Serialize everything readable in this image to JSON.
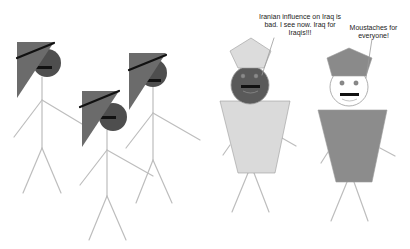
{
  "scene": {
    "background": "#ffffff",
    "line_color": "#bdbdbd",
    "figures": [
      {
        "id": "stick-figure-1",
        "type": "stick",
        "flag": {
          "points": "17,42 54,42 17,98",
          "fill": "#6b6b6b"
        },
        "band": {
          "x1": 17,
          "y1": 58,
          "x2": 54,
          "y2": 43
        },
        "head": {
          "cx": 47,
          "cy": 63,
          "r": 14,
          "fill": "#4e4e4e"
        },
        "mouth": {
          "x": 36,
          "y": 66,
          "w": 16,
          "h": 3
        },
        "body": {
          "x1": 42,
          "y1": 77,
          "x2": 42,
          "y2": 148
        },
        "arms": [
          {
            "x1": 42,
            "y1": 100,
            "x2": 14,
            "y2": 137
          },
          {
            "x1": 42,
            "y1": 100,
            "x2": 82,
            "y2": 124
          }
        ],
        "legs": [
          {
            "x1": 42,
            "y1": 148,
            "x2": 23,
            "y2": 193
          },
          {
            "x1": 42,
            "y1": 148,
            "x2": 61,
            "y2": 193
          }
        ]
      },
      {
        "id": "stick-figure-2",
        "type": "stick",
        "flag": {
          "points": "82,91 119,91 82,147",
          "fill": "#6b6b6b"
        },
        "band": {
          "x1": 80,
          "y1": 107,
          "x2": 119,
          "y2": 91
        },
        "head": {
          "cx": 113,
          "cy": 117,
          "r": 14,
          "fill": "#4e4e4e"
        },
        "mouth": {
          "x": 100,
          "y": 116,
          "w": 16,
          "h": 3
        },
        "body": {
          "x1": 107,
          "y1": 130,
          "x2": 107,
          "y2": 196
        },
        "arms": [
          {
            "x1": 107,
            "y1": 150,
            "x2": 80,
            "y2": 185
          },
          {
            "x1": 107,
            "y1": 150,
            "x2": 153,
            "y2": 176
          }
        ],
        "legs": [
          {
            "x1": 107,
            "y1": 196,
            "x2": 89,
            "y2": 240
          },
          {
            "x1": 107,
            "y1": 196,
            "x2": 126,
            "y2": 240
          }
        ]
      },
      {
        "id": "stick-figure-3",
        "type": "stick",
        "flag": {
          "points": "129,53 166,53 129,110",
          "fill": "#6b6b6b"
        },
        "band": {
          "x1": 129,
          "y1": 70,
          "x2": 166,
          "y2": 55
        },
        "head": {
          "cx": 153,
          "cy": 73,
          "r": 14,
          "fill": "#4e4e4e"
        },
        "mouth": {
          "x": 145,
          "y": 79,
          "w": 16,
          "h": 3
        },
        "body": {
          "x1": 153,
          "y1": 87,
          "x2": 153,
          "y2": 160
        },
        "arms": [
          {
            "x1": 153,
            "y1": 113,
            "x2": 126,
            "y2": 148
          },
          {
            "x1": 153,
            "y1": 113,
            "x2": 200,
            "y2": 140
          }
        ],
        "legs": [
          {
            "x1": 153,
            "y1": 160,
            "x2": 136,
            "y2": 203
          },
          {
            "x1": 153,
            "y1": 160,
            "x2": 172,
            "y2": 203
          }
        ]
      },
      {
        "id": "robed-figure-left",
        "type": "robed",
        "hat": {
          "points": "251,38 271,51 264,68 238,68 230,51",
          "fill": "#dcdcdc"
        },
        "head": {
          "cx": 250,
          "cy": 85,
          "r": 19,
          "fill": "#5a5a5a"
        },
        "eyes": [
          {
            "cx": 243,
            "cy": 76,
            "r": 2.2
          },
          {
            "cx": 256,
            "cy": 76,
            "r": 2.2
          }
        ],
        "eye_fill": "#8a8a8a",
        "mouth": {
          "x": 241,
          "y": 85,
          "w": 19,
          "h": 3
        },
        "robe": {
          "points": "220,101 290,101 275,173 238,173",
          "fill": "#dadada"
        },
        "arms": [
          {
            "x1": 230,
            "y1": 145,
            "x2": 223,
            "y2": 155
          },
          {
            "x1": 282,
            "y1": 138,
            "x2": 296,
            "y2": 146
          }
        ],
        "legs": [
          {
            "x1": 248,
            "y1": 173,
            "x2": 232,
            "y2": 212
          },
          {
            "x1": 254,
            "y1": 173,
            "x2": 269,
            "y2": 212
          }
        ],
        "pointer": {
          "x1": 274,
          "y1": 38,
          "x2": 262,
          "y2": 75
        }
      },
      {
        "id": "robed-figure-right",
        "type": "robed",
        "hat": {
          "points": "349,48 372,58 366,76 332,76 327,58",
          "fill": "#8a8a8a"
        },
        "head": {
          "cx": 349,
          "cy": 87,
          "r": 19,
          "fill": "#ffffff"
        },
        "eyes": [
          {
            "cx": 342,
            "cy": 83,
            "r": 2.2
          },
          {
            "cx": 356,
            "cy": 83,
            "r": 2.2
          }
        ],
        "eye_fill": "#8a8a8a",
        "mouth": {
          "x": 340,
          "y": 93,
          "w": 19,
          "h": 3
        },
        "robe": {
          "points": "318,110 387,110 372,182 336,182",
          "fill": "#8c8c8c"
        },
        "arms": [
          {
            "x1": 328,
            "y1": 152,
            "x2": 321,
            "y2": 163
          },
          {
            "x1": 380,
            "y1": 148,
            "x2": 395,
            "y2": 156
          }
        ],
        "legs": [
          {
            "x1": 347,
            "y1": 182,
            "x2": 331,
            "y2": 221
          },
          {
            "x1": 354,
            "y1": 182,
            "x2": 368,
            "y2": 221
          }
        ],
        "pointer": {
          "x1": 372,
          "y1": 39,
          "x2": 366,
          "y2": 78
        }
      }
    ]
  },
  "captions": {
    "left": {
      "line1": "Iranian influence on Iraq is",
      "line2": "bad.  I see now.  Iraq for",
      "line3": "Iraqis!!!"
    },
    "right": {
      "line1": "Moustaches for",
      "line2": "everyone!"
    }
  }
}
